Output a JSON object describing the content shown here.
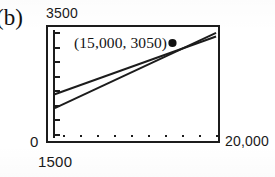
{
  "figure": {
    "panel_label": "(b)",
    "annotation": "(15,000, 3050)"
  },
  "axes": {
    "y_max_label": "3500",
    "y_min_label": "0",
    "x_min_label": "1500",
    "x_max_label": "20,000"
  },
  "chart_data": {
    "type": "line",
    "title": "(b)",
    "xlabel": "",
    "ylabel": "",
    "xlim": [
      1500,
      20000
    ],
    "ylim": [
      0,
      3500
    ],
    "grid": false,
    "legend": "none",
    "x_tick_labels": [
      "1500",
      "20,000"
    ],
    "y_tick_labels": [
      "0",
      "3500"
    ],
    "x_tick_count": 10,
    "y_tick_count": 8,
    "annotations": [
      {
        "text": "(15,000, 3050)",
        "x": 15000,
        "y": 3050,
        "marker": "filled-circle"
      }
    ],
    "series": [
      {
        "name": "upper-line",
        "x": [
          1500,
          20000
        ],
        "values": [
          1300,
          3275
        ]
      },
      {
        "name": "lower-line",
        "x": [
          1500,
          20000
        ],
        "values": [
          830,
          3400
        ]
      }
    ],
    "intersection": {
      "x": 15000,
      "y": 3050
    }
  }
}
